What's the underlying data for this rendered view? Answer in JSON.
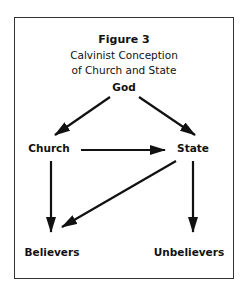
{
  "figure": {
    "title": "Figure 3",
    "subtitle_line1": "Calvinist Conception",
    "subtitle_line2": "of Church and State"
  },
  "nodes": {
    "god": "God",
    "church": "Church",
    "state": "State",
    "believers": "Believers",
    "unbelievers": "Unbelievers"
  },
  "edges": [
    {
      "from": "God",
      "to": "Church"
    },
    {
      "from": "God",
      "to": "State"
    },
    {
      "from": "Church",
      "to": "State"
    },
    {
      "from": "Church",
      "to": "Believers"
    },
    {
      "from": "State",
      "to": "Believers"
    },
    {
      "from": "State",
      "to": "Unbelievers"
    }
  ],
  "colors": {
    "line": "#111111",
    "frame": "#333333"
  }
}
